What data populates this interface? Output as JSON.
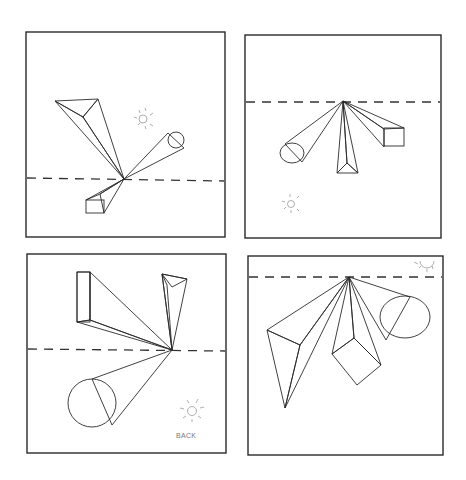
{
  "drawing": {
    "subject": "One-point perspective pencil exercise — four panels",
    "panels": [
      {
        "id": "top-left",
        "vanishing_point": "center on horizon",
        "objects": [
          "triangular prism",
          "cylinder",
          "rectangular box"
        ],
        "sun_position": "upper right"
      },
      {
        "id": "top-right",
        "vanishing_point": "center on horizon (high)",
        "objects": [
          "cylinder",
          "triangular prism",
          "rectangular box"
        ],
        "sun_position": "lower left"
      },
      {
        "id": "bottom-left",
        "vanishing_point": "right of center on horizon",
        "objects": [
          "rectangular box",
          "triangular prism",
          "cylinder"
        ],
        "sun_position": "lower right (back)"
      },
      {
        "id": "bottom-right",
        "vanishing_point": "top center on horizon",
        "objects": [
          "triangular prism",
          "cube",
          "cylinder"
        ],
        "sun_position": "upper right corner"
      }
    ],
    "annotation": "BACK"
  },
  "colors": {
    "line": "#2b2b2b",
    "shade_dark": "#6e6e6e",
    "shade_mid": "#a5a5a5",
    "shade_light": "#d8d8d8",
    "paper": "#ffffff"
  }
}
